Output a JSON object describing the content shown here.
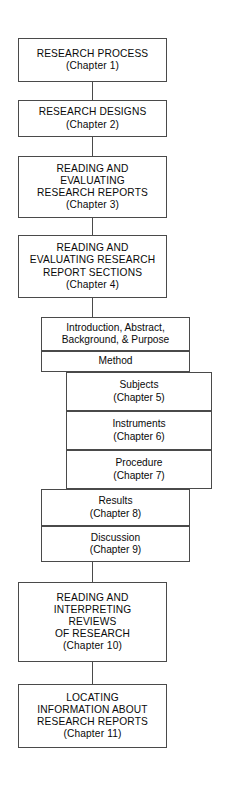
{
  "diagram": {
    "stroke_color": "#4a4a4a",
    "text_color": "#0a0a0a",
    "background_color": "#ffffff"
  },
  "nodes": {
    "research_process": {
      "line1": "RESEARCH PROCESS",
      "line2": "(Chapter 1)"
    },
    "research_designs": {
      "line1": "RESEARCH DESIGNS",
      "line2": "(Chapter 2)"
    },
    "reading_evaluating_reports": {
      "line1": "READING AND",
      "line2": "EVALUATING",
      "line3": "RESEARCH REPORTS",
      "line4": "(Chapter 3)"
    },
    "reading_evaluating_sections": {
      "line1": "READING AND",
      "line2": "EVALUATING RESEARCH",
      "line3": "REPORT SECTIONS",
      "line4": "(Chapter 4)"
    },
    "introduction": {
      "line1": "Introduction, Abstract,",
      "line2": "Background, & Purpose"
    },
    "method": {
      "line1": "Method"
    },
    "subjects": {
      "line1": "Subjects",
      "line2": "(Chapter 5)"
    },
    "instruments": {
      "line1": "Instruments",
      "line2": "(Chapter 6)"
    },
    "procedure": {
      "line1": "Procedure",
      "line2": "(Chapter 7)"
    },
    "results": {
      "line1": "Results",
      "line2": "(Chapter 8)"
    },
    "discussion": {
      "line1": "Discussion",
      "line2": "(Chapter 9)"
    },
    "reading_interpreting_reviews": {
      "line1": "READING AND",
      "line2": "INTERPRETING",
      "line3": "REVIEWS",
      "line4": "OF RESEARCH",
      "line5": "(Chapter 10)"
    },
    "locating_information": {
      "line1": "LOCATING",
      "line2": "INFORMATION ABOUT",
      "line3": "RESEARCH REPORTS",
      "line4": "(Chapter 11)"
    }
  }
}
